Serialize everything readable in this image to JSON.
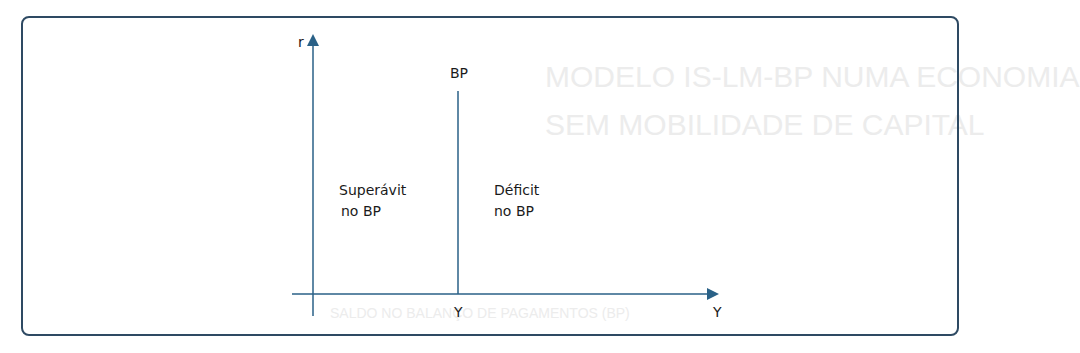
{
  "background_text": {
    "line1": "MODELO IS-LM-BP NUMA ECONOMIA",
    "line2": "SEM MOBILIDADE DE CAPITAL",
    "line3": "SALDO NO BALANÇO DE PAGAMENTOS (BP)"
  },
  "diagram": {
    "y_axis_label": "r",
    "x_axis_label": "Y",
    "curve_label": "BP",
    "curve_x_label": "Y",
    "left_region": {
      "line1": "Superávit",
      "line2": "no BP"
    },
    "right_region": {
      "line1": "Déficit",
      "line2": "no BP"
    },
    "colors": {
      "axis": "#2a6187",
      "frame": "#2e4a63",
      "text": "#1a1a1a"
    }
  }
}
